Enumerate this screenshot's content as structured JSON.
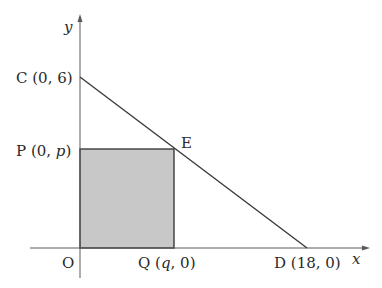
{
  "diagram": {
    "axes": {
      "x_label": "x",
      "y_label": "y",
      "origin_label": "O"
    },
    "points": {
      "C": {
        "name": "C",
        "coords": "(0, 6)"
      },
      "P": {
        "name": "P",
        "coords_prefix": "(0, ",
        "coords_var": "p",
        "coords_suffix": ")"
      },
      "E": {
        "name": "E"
      },
      "Q": {
        "name": "Q",
        "coords_prefix": "(",
        "coords_var": "q",
        "coords_suffix": ", 0)"
      },
      "D": {
        "name": "D",
        "coords": "(18, 0)"
      }
    },
    "shaded_rectangle": {
      "vertices": [
        "O",
        "P",
        "E",
        "Q"
      ],
      "fill": "#c8c8c8"
    },
    "line_segment": {
      "from": "C",
      "to": "D"
    },
    "colors": {
      "stroke": "#3a3a3a",
      "axis": "#5a5a5a",
      "fill": "#c8c8c8"
    }
  }
}
